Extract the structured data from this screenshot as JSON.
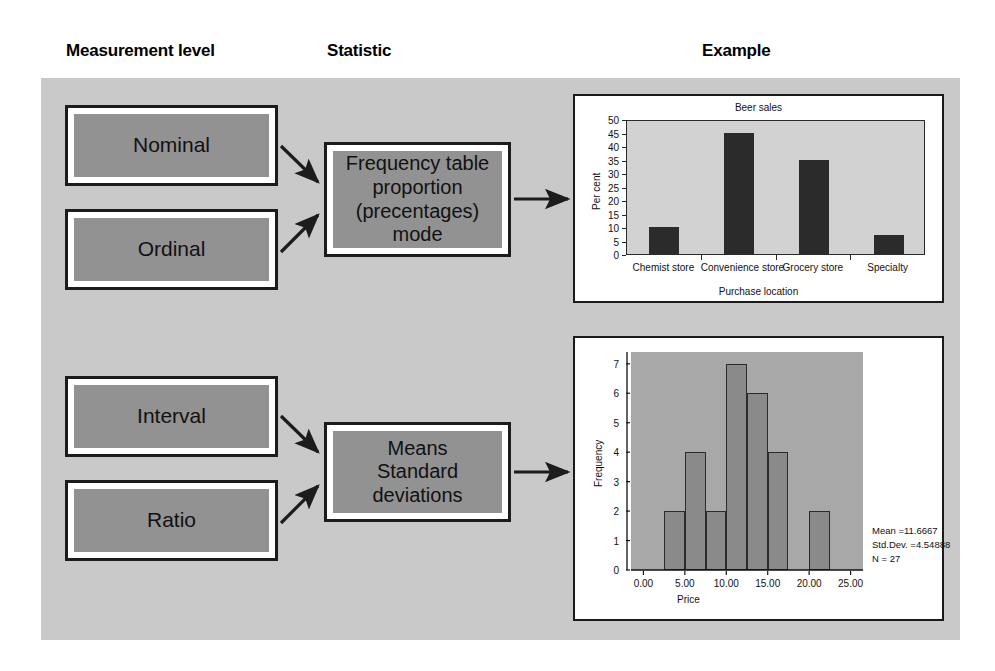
{
  "headings": {
    "measurement": "Measurement level",
    "statistic": "Statistic",
    "example": "Example"
  },
  "nodes": {
    "nominal": "Nominal",
    "ordinal": "Ordinal",
    "interval": "Interval",
    "ratio": "Ratio",
    "frequency": "Frequency table\nproportion\n(precentages)\nmode",
    "means": "Means\nStandard\ndeviations"
  },
  "colors": {
    "panel_bg": "#c9c9c9",
    "node_fill": "#929292",
    "node_border": "#1c1c1c",
    "bar_fill": "#2b2b2b",
    "bar_plot_bg": "#d2d2d2",
    "hist_plot_bg": "#a8a8a8",
    "hist_bar_fill": "#8a8a8a"
  },
  "chart_data": [
    {
      "type": "bar",
      "title": "Beer sales",
      "xlabel": "Purchase location",
      "ylabel": "Per cent",
      "categories": [
        "Chemist store",
        "Convenience store",
        "Grocery store",
        "Specialty"
      ],
      "values": [
        10,
        45,
        35,
        7
      ],
      "ylim": [
        0,
        50
      ],
      "yticks": [
        0,
        5,
        10,
        15,
        20,
        25,
        30,
        35,
        40,
        45,
        50
      ],
      "ytick_labels": [
        "0",
        "5",
        "10",
        "15",
        "20",
        "25",
        "30",
        "35",
        "40",
        "45",
        "50"
      ],
      "grid": false,
      "legend": "none"
    },
    {
      "type": "histogram",
      "title": "",
      "xlabel": "Price",
      "ylabel": "Frequency",
      "xlim": [
        -1.5,
        26.5
      ],
      "ylim": [
        0,
        7.4
      ],
      "yticks": [
        0,
        1,
        2,
        3,
        4,
        5,
        6,
        7
      ],
      "ytick_labels": [
        "0",
        "1",
        "2",
        "3",
        "4",
        "5",
        "6",
        "7"
      ],
      "xticks": [
        0,
        5,
        10,
        15,
        20,
        25
      ],
      "xtick_labels": [
        "0.00",
        "5.00",
        "10.00",
        "15.00",
        "20.00",
        "25.00"
      ],
      "bins": [
        {
          "x0": 2.5,
          "x1": 5.0,
          "count": 2
        },
        {
          "x0": 5.0,
          "x1": 7.5,
          "count": 4
        },
        {
          "x0": 7.5,
          "x1": 10.0,
          "count": 2
        },
        {
          "x0": 10.0,
          "x1": 12.5,
          "count": 7
        },
        {
          "x0": 12.5,
          "x1": 15.0,
          "count": 6
        },
        {
          "x0": 15.0,
          "x1": 17.5,
          "count": 4
        },
        {
          "x0": 20.0,
          "x1": 22.5,
          "count": 2
        }
      ],
      "normal_curve": true,
      "annotations": {
        "mean": "Mean =11.6667",
        "std_dev": "Std.Dev. =4.54888",
        "n": "N = 27"
      },
      "grid": false,
      "legend": "none"
    }
  ]
}
